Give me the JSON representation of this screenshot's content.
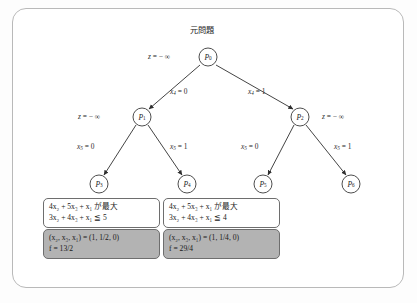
{
  "figure": {
    "root_caption": "元問題",
    "nodes": [
      {
        "id": "P0",
        "label_base": "P",
        "label_sub": "0",
        "cx": 208,
        "cy": 57
      },
      {
        "id": "P1",
        "label_base": "P",
        "label_sub": "1",
        "cx": 142,
        "cy": 117
      },
      {
        "id": "P2",
        "label_base": "P",
        "label_sub": "2",
        "cx": 300,
        "cy": 117
      },
      {
        "id": "P3",
        "label_base": "P",
        "label_sub": "3",
        "cx": 99,
        "cy": 184
      },
      {
        "id": "P4",
        "label_base": "P",
        "label_sub": "4",
        "cx": 187,
        "cy": 184
      },
      {
        "id": "P5",
        "label_base": "P",
        "label_sub": "5",
        "cx": 263,
        "cy": 184
      },
      {
        "id": "P6",
        "label_base": "P",
        "label_sub": "6",
        "cx": 351,
        "cy": 184
      }
    ],
    "bound_labels": [
      {
        "name": "bound-root",
        "text": "z = − ∞",
        "x": 148,
        "y": 55
      },
      {
        "name": "bound-p1",
        "text": "z = − ∞",
        "x": 82,
        "y": 115
      },
      {
        "name": "bound-p2",
        "text": "z = − ∞",
        "x": 322,
        "y": 115
      }
    ],
    "edge_labels": [
      {
        "name": "edge-label-x4-0",
        "var": "x",
        "sub": "4",
        "value": "0",
        "x": 172,
        "y": 92
      },
      {
        "name": "edge-label-x4-1",
        "var": "x",
        "sub": "4",
        "value": "1",
        "x": 250,
        "y": 92
      },
      {
        "name": "edge-label-x5-0-left",
        "var": "x",
        "sub": "5",
        "value": "0",
        "x": 87,
        "y": 147
      },
      {
        "name": "edge-label-x5-1-left",
        "var": "x",
        "sub": "5",
        "value": "1",
        "x": 178,
        "y": 147
      },
      {
        "name": "edge-label-x5-0-right",
        "var": "x",
        "sub": "5",
        "value": "0",
        "x": 250,
        "y": 147
      },
      {
        "name": "edge-label-x5-1-right",
        "var": "x",
        "sub": "5",
        "value": "1",
        "x": 340,
        "y": 147
      }
    ],
    "panels": [
      {
        "name": "panel-p3",
        "objective": "4x₂ + 5x₃ + x₁ が最大",
        "constraint": "3x₂ + 4x₃ + x₁ ≦ 5",
        "solution": "(x₂, x₃, x₁) = (1, 1/2, 0)",
        "objective_value": "f = 13/2"
      },
      {
        "name": "panel-p4",
        "objective": "4x₂ + 5x₃ + x₁ が最大",
        "constraint": "3x₂ + 4x₃ + x₁ ≦ 4",
        "solution": "(x₂, x₃, x₁) = (1, 1/4, 0)",
        "objective_value": "f = 29/4"
      }
    ],
    "colors": {
      "frame_border": "#b9b9b9",
      "node_stroke": "#3a3a3a",
      "edge_stroke": "#2f2f2f",
      "panel_gray": "#b3b3b3",
      "panel_white": "#ffffff",
      "text": "#1a1a1a"
    }
  }
}
